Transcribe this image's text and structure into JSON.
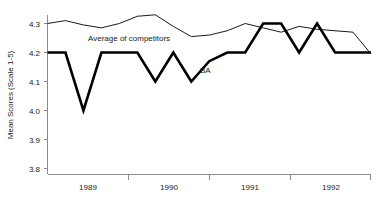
{
  "chart_data": {
    "type": "line",
    "title": "",
    "xlabel": "",
    "ylabel": "Mean Scores (Scale 1-5)",
    "ylim": [
      3.8,
      4.35
    ],
    "yticks": [
      "4.3",
      "4.2",
      "4.1",
      "4.0",
      "3.9",
      "3.8"
    ],
    "ytick_values": [
      4.3,
      4.2,
      4.1,
      4.0,
      3.9,
      3.8
    ],
    "xtick_labels": [
      "1989",
      "1990",
      "1991",
      "1992"
    ],
    "x": [
      0,
      1,
      2,
      3,
      4,
      5,
      6,
      7,
      8,
      9,
      10,
      11,
      12,
      13,
      14,
      15,
      16,
      17,
      18
    ],
    "grid": false,
    "legend_position": "inline-annotation",
    "annotations": [
      {
        "text": "Average of competitors",
        "series": "Average of competitors",
        "x": 2.0,
        "y": 4.27
      },
      {
        "text": "BA",
        "series": "BA",
        "x": 8.6,
        "y": 4.155
      }
    ],
    "series": [
      {
        "name": "Average of competitors",
        "style": "thin",
        "values": [
          4.3,
          4.31,
          4.295,
          4.285,
          4.3,
          4.325,
          4.33,
          4.29,
          4.255,
          4.26,
          4.275,
          4.3,
          4.285,
          4.27,
          4.29,
          4.28,
          4.275,
          4.27,
          4.195
        ]
      },
      {
        "name": "BA",
        "style": "thick",
        "values": [
          4.2,
          4.2,
          4.0,
          4.2,
          4.2,
          4.2,
          4.1,
          4.2,
          4.1,
          4.17,
          4.2,
          4.2,
          4.3,
          4.3,
          4.2,
          4.3,
          4.2,
          4.2,
          4.2
        ]
      }
    ]
  },
  "axis": {
    "y_title": "Mean Scores (Scale 1-5)"
  }
}
